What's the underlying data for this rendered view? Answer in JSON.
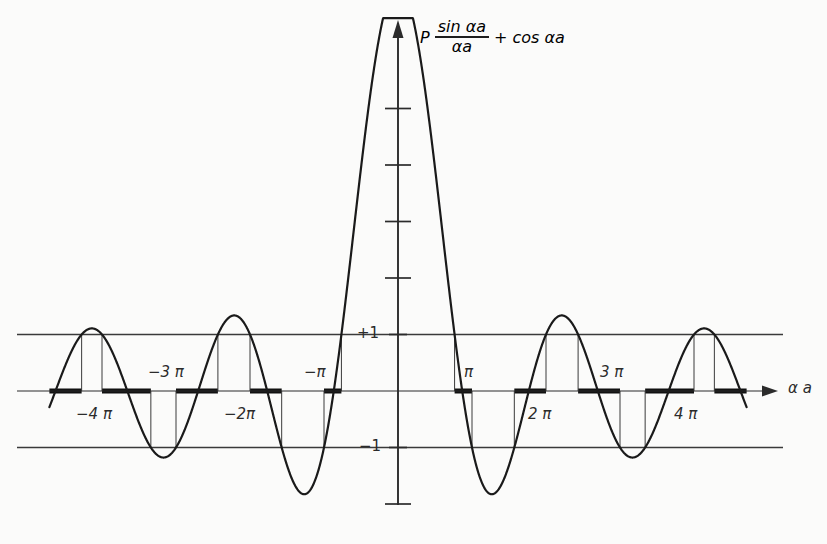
{
  "figure": {
    "title_parts": {
      "p": "P",
      "numerator": "sin αa",
      "denominator": "αa",
      "plus": "+",
      "cos_term": "cos αa"
    },
    "axis_label_x": "α a",
    "y_tick_labels": {
      "plus_one": "+1",
      "minus_one": "−1"
    },
    "x_tick_labels": [
      "−4 π",
      "−3 π",
      "−2π",
      "−π",
      "π",
      "2 π",
      "3 π",
      "4 π"
    ],
    "colors": {
      "curve": "#1a1a1a",
      "axis": "#2b2b2b",
      "guide": "#3a3a3a",
      "band": "#111111",
      "background": "#fbfbfa",
      "label": "#2b2b2b"
    }
  },
  "chart_data": {
    "type": "line",
    "xlabel": "α a",
    "ylabel": "",
    "xlim": [
      -14.8,
      14.8
    ],
    "ylim": [
      -1.75,
      6.55
    ],
    "grid": false,
    "legend": null,
    "function": "P*sin(x)/x + cos(x)",
    "P": 6.2,
    "y_ticks": [
      1,
      2,
      3,
      4,
      5,
      -1,
      -2
    ],
    "y_tick_labels_shown": [
      "+1",
      "−1"
    ],
    "x_ticks": [
      -12.566,
      -9.425,
      -6.283,
      -3.142,
      3.142,
      6.283,
      9.425,
      12.566
    ],
    "x_tick_labels_shown": [
      "−4 π",
      "−3 π",
      "−2π",
      "−π",
      "π",
      "2 π",
      "3 π",
      "4 π"
    ],
    "guide_lines_y": [
      1,
      -1
    ],
    "x_samples": [
      -14.8,
      -14.4,
      -14.0,
      -13.6,
      -13.2,
      -12.8,
      -12.4,
      -12.0,
      -11.6,
      -11.2,
      -10.8,
      -10.4,
      -10.0,
      -9.6,
      -9.2,
      -8.8,
      -8.4,
      -8.0,
      -7.6,
      -7.2,
      -6.8,
      -6.4,
      -6.0,
      -5.6,
      -5.2,
      -4.8,
      -4.4,
      -4.0,
      -3.6,
      -3.2,
      -2.8,
      -2.4,
      -2.0,
      -1.6,
      -1.2,
      -0.8,
      -0.4,
      0.0,
      0.4,
      0.8,
      1.2,
      1.6,
      2.0,
      2.4,
      2.8,
      3.2,
      3.6,
      4.0,
      4.4,
      4.8,
      5.2,
      5.6,
      6.0,
      6.4,
      6.8,
      7.2,
      7.6,
      8.0,
      8.4,
      8.8,
      9.2,
      9.6,
      10.0,
      10.4,
      10.8,
      11.2,
      11.6,
      12.0,
      12.4,
      12.8,
      13.2,
      13.6,
      14.0,
      14.4,
      14.8
    ],
    "allowed_bands": [
      [
        -14.8,
        -13.9
      ],
      [
        -13.2,
        -11.1
      ],
      [
        -10.2,
        -8.2
      ],
      [
        -7.0,
        -5.2
      ],
      [
        -3.6,
        -2.3
      ],
      [
        2.3,
        3.6
      ],
      [
        5.2,
        7.0
      ],
      [
        8.2,
        10.2
      ],
      [
        11.1,
        13.2
      ],
      [
        13.9,
        14.8
      ]
    ],
    "band_description": "Thick segments on the x-axis mark allowed energy bands where |P sin(αa)/(αa) + cos(αa)| ≤ 1; gaps are forbidden bands."
  }
}
